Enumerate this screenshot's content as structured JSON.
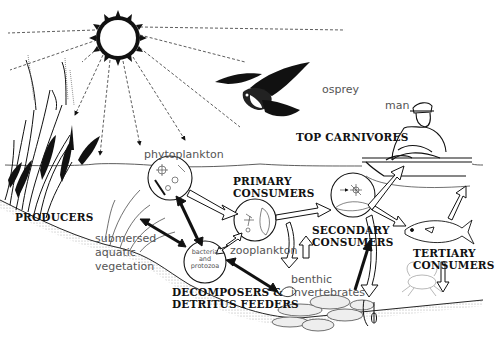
{
  "diagram": {
    "type": "food-web",
    "labels": {
      "osprey": "osprey",
      "man": "man",
      "top_carnivores": "TOP CARNIVORES",
      "phytoplankton": "phytoplankton",
      "primary_consumers_1": "PRIMARY",
      "primary_consumers_2": "CONSUMERS",
      "producers": "PRODUCERS",
      "submersed_1": "submersed",
      "submersed_2": "aquatic",
      "submersed_3": "vegetation",
      "zooplankton": "zooplankton",
      "secondary_consumers_1": "SECONDARY",
      "secondary_consumers_2": "CONSUMERS",
      "tertiary_consumers_1": "TERTIARY",
      "tertiary_consumers_2": "CONSUMERS",
      "bacteria_1": "bacteria",
      "bacteria_2": "and",
      "bacteria_3": "protozoa",
      "benthic_1": "benthic",
      "benthic_2": "invertebrates",
      "decomposers_1": "DECOMPOSERS &",
      "decomposers_2": "DETRITUS FEEDERS"
    },
    "colors": {
      "ink": "#111111",
      "label_gray": "#555555",
      "background": "#ffffff"
    }
  }
}
